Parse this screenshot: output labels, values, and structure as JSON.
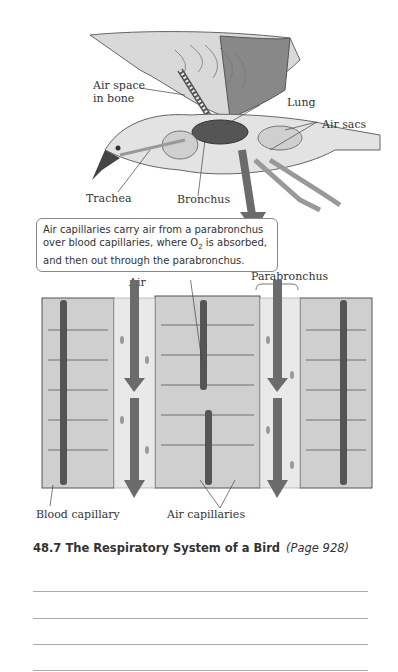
{
  "figure": {
    "bird_labels": {
      "air_space_line1": "Air space",
      "air_space_line2": "in bone",
      "lung": "Lung",
      "air_sacs": "Air sacs",
      "trachea": "Trachea",
      "bronchus": "Bronchus"
    },
    "callout_text_1": "Air capillaries carry air from a parabronchus",
    "callout_text_2a": "over blood capillaries, where O",
    "callout_sub": "2",
    "callout_text_2b": " is absorbed,",
    "callout_text_3": "and then out through the parabronchus.",
    "tissue_labels": {
      "air": "Air",
      "parabronchus": "Parabronchus",
      "blood_capillary": "Blood capillary",
      "air_capillaries": "Air capillaries"
    }
  },
  "caption": {
    "number_title": "48.7 The Respiratory System of a Bird",
    "page_ref": "(Page 928)"
  },
  "answer_lines": 4,
  "colors": {
    "arrow": "#6b6b6b",
    "tissue": "#c8c8c8",
    "vessel": "#555555"
  }
}
